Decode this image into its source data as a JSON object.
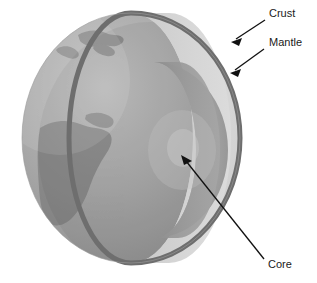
{
  "diagram": {
    "background_color": "#ffffff"
  },
  "labels": [
    {
      "id": "crust",
      "text": "Crust",
      "x": 269,
      "y": 14,
      "arrow": {
        "from_x": 265,
        "from_y": 20,
        "to_x": 232,
        "to_y": 42
      }
    },
    {
      "id": "mantle",
      "text": "Mantle",
      "x": 269,
      "y": 43,
      "arrow": {
        "from_x": 264,
        "from_y": 49,
        "to_x": 231,
        "to_y": 73
      }
    },
    {
      "id": "core",
      "text": "Core",
      "x": 268,
      "y": 265,
      "arrow": {
        "from_x": 264,
        "from_y": 259,
        "to_x": 181,
        "to_y": 156
      }
    }
  ],
  "layers": {
    "crust": {
      "name": "Crust",
      "color": "#6e6e6e"
    },
    "mantle": {
      "name": "Mantle",
      "color": "#d2d2d2"
    },
    "mantle_shaded": {
      "name": "Mantle shaded",
      "color": "#bdbdbd"
    },
    "core": {
      "name": "Core",
      "color": "#9a9a9a"
    },
    "core_highlight": {
      "name": "Core highlight",
      "color": "#b4b4b4"
    },
    "surface_ocean": {
      "name": "Ocean surface",
      "color": "#a9a9a9"
    },
    "surface_land": {
      "name": "Land surface",
      "color": "#8e8e8e"
    },
    "surface_shadow": {
      "name": "Surface shadow",
      "color": "#8a8a8a"
    }
  },
  "geometry": {
    "globe_center_x": 131,
    "globe_center_y": 138,
    "globe_radius_x": 109,
    "globe_radius_y": 125
  }
}
